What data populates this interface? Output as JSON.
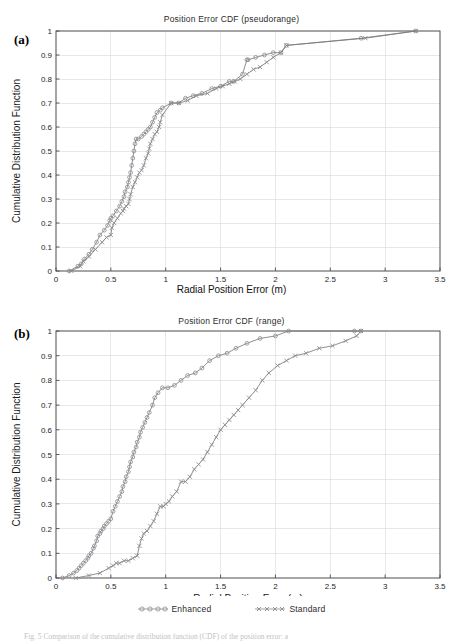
{
  "figure": {
    "panel_a_letter": "(a)",
    "panel_b_letter": "(b)",
    "caption": "Fig. 5  Comparison of the cumulative distribution function (CDF) of the position error: a"
  },
  "legend": {
    "position": "bottom-center",
    "entries": [
      {
        "label": "Enhanced",
        "marker": "circle-marker-icon",
        "color": "#8a8a8f"
      },
      {
        "label": "Standard",
        "marker": "x-marker-icon",
        "color": "#8a8a8f"
      }
    ]
  },
  "chart_data": [
    {
      "id": "panel-a",
      "type": "line",
      "title": "Position Error CDF (pseudorange)",
      "xlabel": "Radial Position Error (m)",
      "ylabel": "Cumulative Distribution Function",
      "xlim": [
        0,
        3.5
      ],
      "ylim": [
        0,
        1
      ],
      "xticks": [
        0,
        0.5,
        1,
        1.5,
        2,
        2.5,
        3,
        3.5
      ],
      "xticklabels": [
        "0",
        "0.5",
        "1",
        "1.5",
        "2",
        "2.5",
        "3",
        "3.5"
      ],
      "yticks": [
        0,
        0.1,
        0.2,
        0.3,
        0.4,
        0.5,
        0.6,
        0.7,
        0.8,
        0.9,
        1
      ],
      "yticklabels": [
        "0",
        "0.1",
        "0.2",
        "0.3",
        "0.4",
        "0.5",
        "0.6",
        "0.7",
        "0.8",
        "0.9",
        "1"
      ],
      "grid": true,
      "series": [
        {
          "name": "Enhanced",
          "marker": "circle",
          "x": [
            0.12,
            0.2,
            0.23,
            0.26,
            0.3,
            0.33,
            0.37,
            0.4,
            0.44,
            0.47,
            0.49,
            0.5,
            0.52,
            0.55,
            0.58,
            0.6,
            0.62,
            0.63,
            0.65,
            0.66,
            0.67,
            0.68,
            0.69,
            0.7,
            0.71,
            0.72,
            0.73,
            0.75,
            0.78,
            0.8,
            0.82,
            0.84,
            0.86,
            0.88,
            0.9,
            0.92,
            0.95,
            0.97,
            1.05,
            1.12,
            1.18,
            1.25,
            1.33,
            1.42,
            1.5,
            1.58,
            1.62,
            1.7,
            1.74,
            1.75,
            1.82,
            1.9,
            1.98,
            2.05,
            2.1,
            2.78,
            3.28
          ],
          "y": [
            0.0,
            0.02,
            0.03,
            0.05,
            0.07,
            0.09,
            0.12,
            0.15,
            0.17,
            0.19,
            0.21,
            0.22,
            0.23,
            0.25,
            0.27,
            0.29,
            0.31,
            0.33,
            0.35,
            0.37,
            0.39,
            0.41,
            0.44,
            0.47,
            0.5,
            0.53,
            0.55,
            0.55,
            0.56,
            0.57,
            0.58,
            0.59,
            0.6,
            0.62,
            0.64,
            0.66,
            0.67,
            0.68,
            0.7,
            0.7,
            0.72,
            0.73,
            0.74,
            0.76,
            0.77,
            0.79,
            0.79,
            0.82,
            0.88,
            0.88,
            0.89,
            0.9,
            0.91,
            0.91,
            0.94,
            0.97,
            1.0
          ]
        },
        {
          "name": "Standard",
          "marker": "x",
          "x": [
            0.14,
            0.22,
            0.25,
            0.3,
            0.36,
            0.42,
            0.46,
            0.5,
            0.51,
            0.53,
            0.56,
            0.59,
            0.61,
            0.62,
            0.64,
            0.66,
            0.67,
            0.68,
            0.7,
            0.72,
            0.74,
            0.76,
            0.78,
            0.8,
            0.82,
            0.84,
            0.85,
            0.86,
            0.88,
            0.9,
            0.92,
            0.94,
            0.95,
            0.97,
            1.05,
            1.12,
            1.2,
            1.28,
            1.38,
            1.46,
            1.52,
            1.58,
            1.63,
            1.68,
            1.74,
            1.8,
            1.86,
            1.92,
            1.98,
            2.05,
            2.1,
            2.82,
            3.28
          ],
          "y": [
            0.0,
            0.02,
            0.04,
            0.06,
            0.09,
            0.12,
            0.14,
            0.15,
            0.18,
            0.2,
            0.22,
            0.24,
            0.25,
            0.26,
            0.27,
            0.28,
            0.3,
            0.32,
            0.35,
            0.37,
            0.39,
            0.41,
            0.42,
            0.44,
            0.47,
            0.49,
            0.51,
            0.53,
            0.55,
            0.57,
            0.58,
            0.6,
            0.62,
            0.65,
            0.7,
            0.7,
            0.71,
            0.73,
            0.74,
            0.76,
            0.77,
            0.78,
            0.79,
            0.8,
            0.82,
            0.84,
            0.85,
            0.87,
            0.89,
            0.91,
            0.94,
            0.97,
            1.0
          ]
        }
      ]
    },
    {
      "id": "panel-b",
      "type": "line",
      "title": "Position Error CDF (range)",
      "xlabel": "Radial Position Error (m)",
      "ylabel": "Cumulative Distribution Function",
      "xlim": [
        0,
        3.5
      ],
      "ylim": [
        0,
        1
      ],
      "xticks": [
        0,
        0.5,
        1,
        1.5,
        2,
        2.5,
        3,
        3.5
      ],
      "xticklabels": [
        "0",
        "0.5",
        "1",
        "1.5",
        "2",
        "2.5",
        "3",
        "3.5"
      ],
      "yticks": [
        0,
        0.1,
        0.2,
        0.3,
        0.4,
        0.5,
        0.6,
        0.7,
        0.8,
        0.9,
        1
      ],
      "yticklabels": [
        "0",
        "0.1",
        "0.2",
        "0.3",
        "0.4",
        "0.5",
        "0.6",
        "0.7",
        "0.8",
        "0.9",
        "1"
      ],
      "grid": true,
      "series": [
        {
          "name": "Enhanced",
          "marker": "circle",
          "x": [
            0.06,
            0.12,
            0.16,
            0.19,
            0.21,
            0.23,
            0.25,
            0.27,
            0.29,
            0.3,
            0.32,
            0.34,
            0.35,
            0.37,
            0.38,
            0.4,
            0.41,
            0.43,
            0.44,
            0.46,
            0.48,
            0.5,
            0.52,
            0.54,
            0.56,
            0.58,
            0.6,
            0.61,
            0.63,
            0.64,
            0.66,
            0.67,
            0.68,
            0.7,
            0.71,
            0.73,
            0.74,
            0.76,
            0.77,
            0.79,
            0.81,
            0.83,
            0.85,
            0.88,
            0.9,
            0.93,
            0.97,
            1.02,
            1.08,
            1.14,
            1.2,
            1.27,
            1.33,
            1.4,
            1.48,
            1.56,
            1.64,
            1.74,
            1.86,
            2.0,
            2.12,
            2.72,
            2.78
          ],
          "y": [
            0.0,
            0.01,
            0.02,
            0.03,
            0.04,
            0.05,
            0.06,
            0.07,
            0.08,
            0.09,
            0.1,
            0.12,
            0.13,
            0.15,
            0.17,
            0.18,
            0.19,
            0.2,
            0.21,
            0.22,
            0.23,
            0.24,
            0.27,
            0.29,
            0.31,
            0.33,
            0.35,
            0.37,
            0.39,
            0.41,
            0.43,
            0.45,
            0.47,
            0.49,
            0.51,
            0.53,
            0.55,
            0.57,
            0.59,
            0.61,
            0.63,
            0.65,
            0.67,
            0.7,
            0.73,
            0.75,
            0.77,
            0.77,
            0.78,
            0.8,
            0.82,
            0.83,
            0.85,
            0.88,
            0.9,
            0.91,
            0.93,
            0.95,
            0.97,
            0.98,
            1.0,
            1.0,
            1.0
          ]
        },
        {
          "name": "Standard",
          "marker": "x",
          "x": [
            0.18,
            0.3,
            0.4,
            0.48,
            0.52,
            0.55,
            0.58,
            0.62,
            0.66,
            0.7,
            0.74,
            0.76,
            0.78,
            0.8,
            0.83,
            0.86,
            0.89,
            0.92,
            0.95,
            0.98,
            1.0,
            1.03,
            1.06,
            1.1,
            1.14,
            1.18,
            1.22,
            1.26,
            1.3,
            1.34,
            1.38,
            1.42,
            1.46,
            1.5,
            1.54,
            1.58,
            1.62,
            1.66,
            1.7,
            1.76,
            1.82,
            1.88,
            1.94,
            2.02,
            2.1,
            2.18,
            2.28,
            2.4,
            2.52,
            2.64,
            2.74,
            2.78
          ],
          "y": [
            0.0,
            0.01,
            0.02,
            0.04,
            0.05,
            0.06,
            0.06,
            0.07,
            0.07,
            0.08,
            0.09,
            0.13,
            0.16,
            0.18,
            0.19,
            0.21,
            0.23,
            0.26,
            0.29,
            0.29,
            0.3,
            0.31,
            0.33,
            0.35,
            0.39,
            0.39,
            0.41,
            0.44,
            0.46,
            0.48,
            0.51,
            0.54,
            0.57,
            0.6,
            0.62,
            0.64,
            0.66,
            0.68,
            0.7,
            0.73,
            0.76,
            0.8,
            0.83,
            0.86,
            0.88,
            0.9,
            0.91,
            0.93,
            0.94,
            0.96,
            0.98,
            1.0
          ]
        }
      ]
    }
  ]
}
